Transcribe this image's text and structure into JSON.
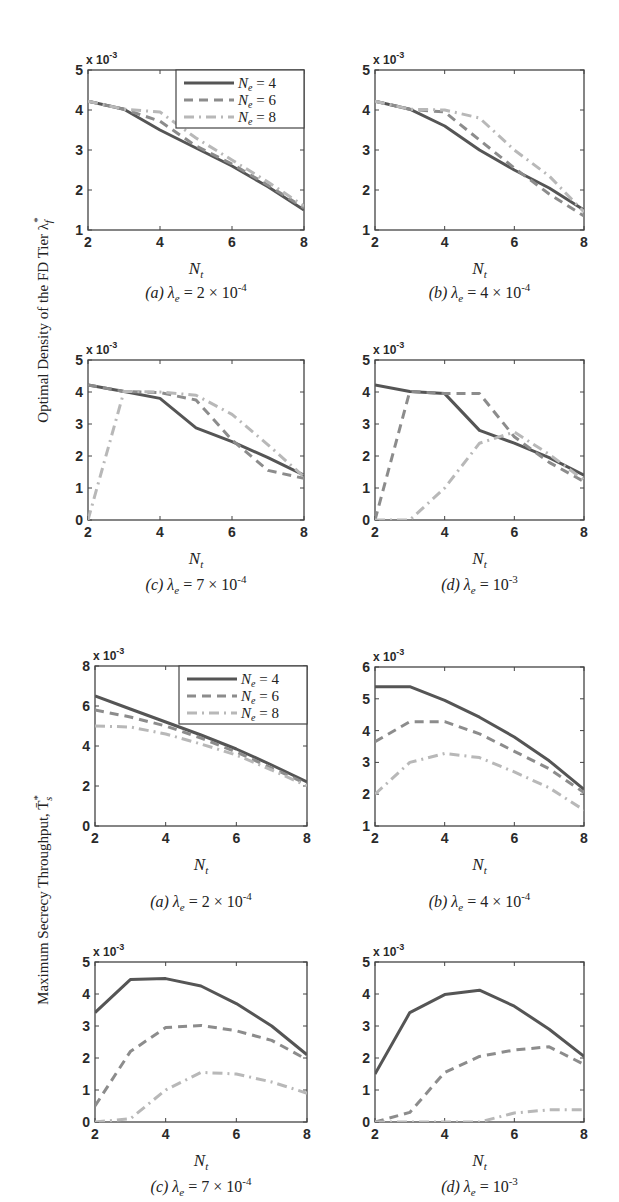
{
  "figure": {
    "top_ylabel": "Optimal Density of the FD Tier λ",
    "top_ylabel_sup": "*",
    "top_ylabel_sub": "f",
    "bottom_ylabel": "Maximum Secrecy Throughput, T̄",
    "bottom_ylabel_sup": "*",
    "bottom_ylabel_sub": "s",
    "xlabel": "N",
    "xlabel_sub": "t",
    "exponent_label": "x 10",
    "exponent_sup": "-3"
  },
  "legend": [
    {
      "label": "N",
      "sub": "e",
      "value": "= 4",
      "style": "solid",
      "color": "#555555"
    },
    {
      "label": "N",
      "sub": "e",
      "value": "= 6",
      "style": "dashed",
      "color": "#8c8c8c"
    },
    {
      "label": "N",
      "sub": "e",
      "value": "= 8",
      "style": "dashdot",
      "color": "#b8b8b8"
    }
  ],
  "chart_data": [
    {
      "type": "line",
      "group": "Optimal Density of the FD Tier",
      "title": "(a) λe = 2 × 10^-4",
      "caption_prefix": "(a)",
      "caption_value": "2 × 10",
      "caption_exp": "-4",
      "xlabel": "Nt",
      "ylabel": "Optimal Density of the FD Tier λf* (x 10^-3)",
      "x": [
        2,
        3,
        4,
        5,
        6,
        7,
        8
      ],
      "xlim": [
        2,
        8
      ],
      "ylim": [
        1,
        5
      ],
      "xticks": [
        2,
        4,
        6,
        8
      ],
      "yticks": [
        1,
        2,
        3,
        4,
        5
      ],
      "legend": true,
      "series": [
        {
          "name": "Ne = 4",
          "values": [
            4.22,
            4.02,
            3.5,
            3.05,
            2.6,
            2.08,
            1.5
          ]
        },
        {
          "name": "Ne = 6",
          "values": [
            4.22,
            4.02,
            3.72,
            3.1,
            2.65,
            2.12,
            1.55
          ]
        },
        {
          "name": "Ne = 8",
          "values": [
            4.22,
            4.02,
            3.95,
            3.3,
            2.75,
            2.2,
            1.6
          ]
        }
      ]
    },
    {
      "type": "line",
      "group": "Optimal Density of the FD Tier",
      "title": "(b) λe = 4 × 10^-4",
      "caption_prefix": "(b)",
      "caption_value": "4 × 10",
      "caption_exp": "-4",
      "xlabel": "Nt",
      "ylabel": "Optimal Density of the FD Tier λf* (x 10^-3)",
      "x": [
        2,
        3,
        4,
        5,
        6,
        7,
        8
      ],
      "xlim": [
        2,
        8
      ],
      "ylim": [
        1,
        5
      ],
      "xticks": [
        2,
        4,
        6,
        8
      ],
      "yticks": [
        1,
        2,
        3,
        4,
        5
      ],
      "legend": false,
      "series": [
        {
          "name": "Ne = 4",
          "values": [
            4.22,
            4.02,
            3.6,
            3.0,
            2.5,
            2.05,
            1.5
          ]
        },
        {
          "name": "Ne = 6",
          "values": [
            4.22,
            4.02,
            3.95,
            3.25,
            2.55,
            1.9,
            1.35
          ]
        },
        {
          "name": "Ne = 8",
          "values": [
            4.22,
            4.02,
            4.0,
            3.8,
            3.0,
            2.35,
            1.45
          ]
        }
      ]
    },
    {
      "type": "line",
      "group": "Optimal Density of the FD Tier",
      "title": "(c) λe = 7 × 10^-4",
      "caption_prefix": "(c)",
      "caption_value": "7 × 10",
      "caption_exp": "-4",
      "xlabel": "Nt",
      "ylabel": "Optimal Density of the FD Tier λf* (x 10^-3)",
      "x": [
        2,
        3,
        4,
        5,
        6,
        7,
        8
      ],
      "xlim": [
        2,
        8
      ],
      "ylim": [
        0,
        5
      ],
      "xticks": [
        2,
        4,
        6,
        8
      ],
      "yticks": [
        0,
        1,
        2,
        3,
        4,
        5
      ],
      "legend": false,
      "series": [
        {
          "name": "Ne = 4",
          "values": [
            4.22,
            4.02,
            3.8,
            2.88,
            2.45,
            1.95,
            1.4
          ]
        },
        {
          "name": "Ne = 6",
          "values": [
            4.22,
            4.02,
            3.98,
            3.75,
            2.5,
            1.55,
            1.3
          ]
        },
        {
          "name": "Ne = 8",
          "values": [
            0.0,
            4.02,
            4.0,
            3.9,
            3.3,
            2.35,
            1.35
          ]
        }
      ]
    },
    {
      "type": "line",
      "group": "Optimal Density of the FD Tier",
      "title": "(d) λe = 10^-3",
      "caption_prefix": "(d)",
      "caption_value": "10",
      "caption_exp": "-3",
      "xlabel": "Nt",
      "ylabel": "Optimal Density of the FD Tier λf* (x 10^-3)",
      "x": [
        2,
        3,
        4,
        5,
        6,
        7,
        8
      ],
      "xlim": [
        2,
        8
      ],
      "ylim": [
        0,
        5
      ],
      "xticks": [
        2,
        4,
        6,
        8
      ],
      "yticks": [
        0,
        1,
        2,
        3,
        4,
        5
      ],
      "legend": false,
      "series": [
        {
          "name": "Ne = 4",
          "values": [
            4.22,
            4.02,
            3.95,
            2.8,
            2.4,
            1.95,
            1.4
          ]
        },
        {
          "name": "Ne = 6",
          "values": [
            0.0,
            4.02,
            3.95,
            3.95,
            2.6,
            1.8,
            1.2
          ]
        },
        {
          "name": "Ne = 8",
          "values": [
            0.0,
            0.0,
            1.0,
            2.4,
            2.75,
            2.05,
            1.25
          ]
        }
      ]
    },
    {
      "type": "line",
      "group": "Maximum Secrecy Throughput",
      "title": "(a) λe = 2 × 10^-4",
      "caption_prefix": "(a)",
      "caption_value": "2 × 10",
      "caption_exp": "-4",
      "xlabel": "Nt",
      "ylabel": "Maximum Secrecy Throughput, T̄s* (x 10^-3)",
      "x": [
        2,
        3,
        4,
        5,
        6,
        7,
        8
      ],
      "xlim": [
        2,
        8
      ],
      "ylim": [
        0,
        8
      ],
      "xticks": [
        2,
        4,
        6,
        8
      ],
      "yticks": [
        0,
        2,
        4,
        6,
        8
      ],
      "legend": true,
      "series": [
        {
          "name": "Ne = 4",
          "values": [
            6.5,
            5.85,
            5.2,
            4.55,
            3.85,
            3.05,
            2.2
          ]
        },
        {
          "name": "Ne = 6",
          "values": [
            5.8,
            5.45,
            5.0,
            4.4,
            3.7,
            2.9,
            2.1
          ]
        },
        {
          "name": "Ne = 8",
          "values": [
            5.0,
            4.95,
            4.6,
            4.1,
            3.55,
            2.8,
            2.0
          ]
        }
      ]
    },
    {
      "type": "line",
      "group": "Maximum Secrecy Throughput",
      "title": "(b) λe = 4 × 10^-4",
      "caption_prefix": "(b)",
      "caption_value": "4 × 10",
      "caption_exp": "-4",
      "xlabel": "Nt",
      "ylabel": "Maximum Secrecy Throughput, T̄s* (x 10^-3)",
      "x": [
        2,
        3,
        4,
        5,
        6,
        7,
        8
      ],
      "xlim": [
        2,
        8
      ],
      "ylim": [
        1,
        6
      ],
      "xticks": [
        2,
        4,
        6,
        8
      ],
      "yticks": [
        1,
        2,
        3,
        4,
        5,
        6
      ],
      "legend": false,
      "series": [
        {
          "name": "Ne = 4",
          "values": [
            5.38,
            5.38,
            4.95,
            4.42,
            3.8,
            3.05,
            2.15
          ]
        },
        {
          "name": "Ne = 6",
          "values": [
            3.65,
            4.28,
            4.28,
            3.9,
            3.35,
            2.8,
            2.05
          ]
        },
        {
          "name": "Ne = 8",
          "values": [
            2.0,
            3.0,
            3.28,
            3.15,
            2.7,
            2.2,
            1.5
          ]
        }
      ]
    },
    {
      "type": "line",
      "group": "Maximum Secrecy Throughput",
      "title": "(c) λe = 7 × 10^-4",
      "caption_prefix": "(c)",
      "caption_value": "7 × 10",
      "caption_exp": "-4",
      "xlabel": "Nt",
      "ylabel": "Maximum Secrecy Throughput, T̄s* (x 10^-3)",
      "x": [
        2,
        3,
        4,
        5,
        6,
        7,
        8
      ],
      "xlim": [
        2,
        8
      ],
      "ylim": [
        0,
        5
      ],
      "xticks": [
        2,
        4,
        6,
        8
      ],
      "yticks": [
        0,
        1,
        2,
        3,
        4,
        5
      ],
      "legend": false,
      "series": [
        {
          "name": "Ne = 4",
          "values": [
            3.42,
            4.45,
            4.48,
            4.25,
            3.7,
            3.0,
            2.1
          ]
        },
        {
          "name": "Ne = 6",
          "values": [
            0.5,
            2.2,
            2.95,
            3.02,
            2.85,
            2.55,
            1.95
          ]
        },
        {
          "name": "Ne = 8",
          "values": [
            0.0,
            0.1,
            1.0,
            1.55,
            1.5,
            1.25,
            0.9
          ]
        }
      ]
    },
    {
      "type": "line",
      "group": "Maximum Secrecy Throughput",
      "title": "(d) λe = 10^-3",
      "caption_prefix": "(d)",
      "caption_value": "10",
      "caption_exp": "-3",
      "xlabel": "Nt",
      "ylabel": "Maximum Secrecy Throughput, T̄s* (x 10^-3)",
      "x": [
        2,
        3,
        4,
        5,
        6,
        7,
        8
      ],
      "xlim": [
        2,
        8
      ],
      "ylim": [
        0,
        5
      ],
      "xticks": [
        2,
        4,
        6,
        8
      ],
      "yticks": [
        0,
        1,
        2,
        3,
        4,
        5
      ],
      "legend": false,
      "series": [
        {
          "name": "Ne = 4",
          "values": [
            1.5,
            3.42,
            3.98,
            4.12,
            3.62,
            2.9,
            2.05
          ]
        },
        {
          "name": "Ne = 6",
          "values": [
            0.0,
            0.3,
            1.55,
            2.05,
            2.25,
            2.35,
            1.8
          ]
        },
        {
          "name": "Ne = 8",
          "values": [
            0.0,
            0.0,
            0.0,
            0.0,
            0.28,
            0.38,
            0.38
          ]
        }
      ]
    }
  ]
}
